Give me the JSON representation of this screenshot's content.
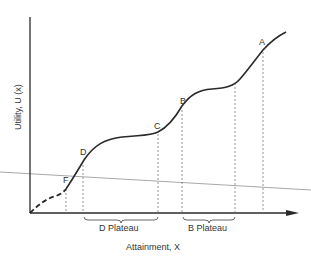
{
  "diagram": {
    "axes": {
      "x_label": "Attainment, X",
      "y_label": "Utility, U (x)"
    },
    "points": [
      {
        "id": "A",
        "label": "A"
      },
      {
        "id": "B",
        "label": "B"
      },
      {
        "id": "C",
        "label": "C"
      },
      {
        "id": "D",
        "label": "D"
      },
      {
        "id": "F",
        "label": "F"
      }
    ],
    "plateaus": [
      {
        "label": "D Plateau"
      },
      {
        "label": "B Plateau"
      }
    ],
    "colors": {
      "curve": "#2a2a2a",
      "axis": "#2a2a2a",
      "guide": "#777777",
      "overlay_line": "#a8a8a8"
    }
  }
}
